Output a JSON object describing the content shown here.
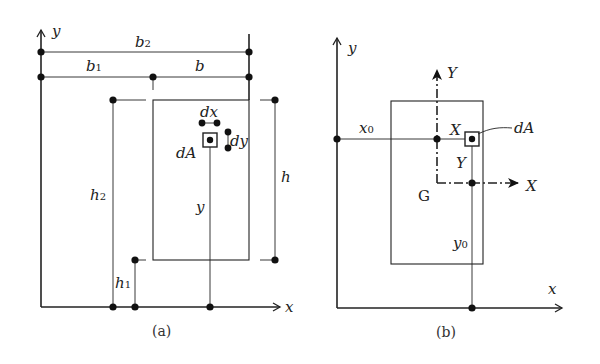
{
  "panel_a": {
    "caption": "(a)",
    "axis_x": "x",
    "axis_y": "y",
    "dim_b2": "b",
    "dim_b2_sub": "2",
    "dim_b1": "b",
    "dim_b1_sub": "1",
    "dim_b": "b",
    "dim_h2": "h",
    "dim_h2_sub": "2",
    "dim_h1": "h",
    "dim_h1_sub": "1",
    "dim_h": "h",
    "dim_y": "y",
    "label_dx": "dx",
    "label_dy": "dy",
    "label_dA": "dA"
  },
  "panel_b": {
    "caption": "(b)",
    "axis_x": "x",
    "axis_y": "y",
    "centroid_axis_X": "X",
    "centroid_axis_Y": "Y",
    "centroid_label": "G",
    "dim_x0": "x",
    "dim_x0_sub": "0",
    "dim_y0": "y",
    "dim_y0_sub": "0",
    "coord_X": "X",
    "coord_Y": "Y",
    "label_dA": "dA"
  }
}
